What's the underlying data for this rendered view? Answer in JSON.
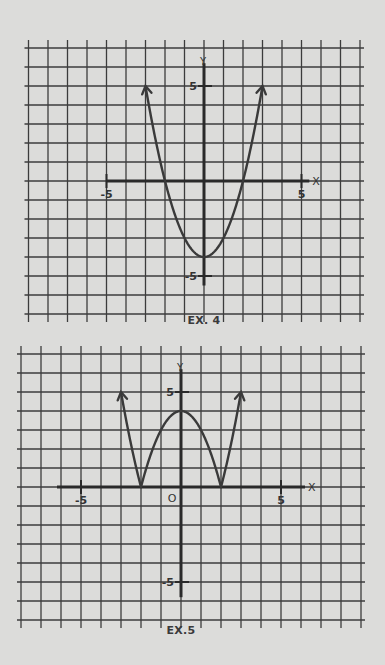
{
  "colors": {
    "paper": "#dcdcda",
    "grid": "#3c3c3c",
    "axis": "#2a2a2a",
    "curve": "#3a3a3a",
    "text": "#333333"
  },
  "chart_data": [
    {
      "type": "line",
      "title": "EX. 4",
      "caption": "EX. 4",
      "function": "y = x^2 - 4",
      "xlabel": "X",
      "ylabel": "Y",
      "x_ticks": [
        {
          "value": -5,
          "label": "-5"
        },
        {
          "value": 5,
          "label": "5"
        }
      ],
      "y_ticks": [
        {
          "value": 5,
          "label": "5"
        },
        {
          "value": -5,
          "label": "-5"
        }
      ],
      "origin_label": "",
      "xlim": [
        -9,
        8
      ],
      "ylim": [
        -7,
        7
      ],
      "grid": true,
      "series": [
        {
          "name": "y = x^2 - 4",
          "x": [
            -3,
            -2.5,
            -2,
            -1.5,
            -1,
            -0.5,
            0,
            0.5,
            1,
            1.5,
            2,
            2.5,
            3
          ],
          "y": [
            5,
            2.25,
            0,
            -1.75,
            -3,
            -3.75,
            -4,
            -3.75,
            -3,
            -1.75,
            0,
            2.25,
            5
          ],
          "arrows_at_ends": true
        }
      ],
      "layout": {
        "origin_px": [
          204,
          181
        ],
        "unit_x_px": 19.5,
        "unit_y_px": 19,
        "xmin_grid": -9,
        "xmax_grid": 8,
        "ymin_grid": -7,
        "ymax_grid": 7,
        "axis_x_range": [
          -5,
          5.4
        ],
        "axis_y_range": [
          -5.5,
          6.2
        ],
        "caption_pos": [
          204,
          322
        ]
      }
    },
    {
      "type": "line",
      "title": "EX. 5",
      "caption": "EX.5",
      "function": "y = |x^2 - 4|",
      "xlabel": "X",
      "ylabel": "Y",
      "x_ticks": [
        {
          "value": -5,
          "label": "-5"
        },
        {
          "value": 5,
          "label": "5"
        }
      ],
      "y_ticks": [
        {
          "value": 5,
          "label": "5"
        },
        {
          "value": -5,
          "label": "-5"
        }
      ],
      "origin_label": "O",
      "xlim": [
        -8,
        9
      ],
      "ylim": [
        -7,
        7
      ],
      "grid": true,
      "series": [
        {
          "name": "y = |x^2 - 4|",
          "x": [
            -3,
            -2.5,
            -2,
            -1.5,
            -1,
            -0.5,
            0,
            0.5,
            1,
            1.5,
            2,
            2.5,
            3
          ],
          "y": [
            5,
            2.25,
            0,
            1.75,
            3,
            3.75,
            4,
            3.75,
            3,
            1.75,
            0,
            2.25,
            5
          ],
          "arrows_at_ends": true
        }
      ],
      "layout": {
        "origin_px": [
          181,
          487
        ],
        "unit_x_px": 20,
        "unit_y_px": 19,
        "xmin_grid": -8,
        "xmax_grid": 9,
        "ymin_grid": -7,
        "ymax_grid": 7,
        "axis_x_range": [
          -6.2,
          6.2
        ],
        "axis_y_range": [
          -5.8,
          6.2
        ],
        "caption_pos": [
          181,
          632
        ]
      }
    }
  ]
}
